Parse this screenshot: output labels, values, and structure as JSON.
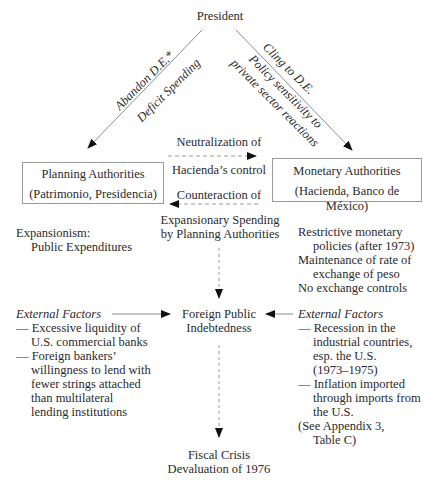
{
  "diagram": {
    "top_node": "President",
    "left_branch": {
      "line1": "Abandon D.E.*",
      "line2": "Deficit Spending"
    },
    "right_branch": {
      "line1": "Cling to D.E.",
      "line2": "Policy sensitivity to",
      "line3": "private sector reactions"
    },
    "planning_box": {
      "title": "Planning Authorities",
      "subtitle": "(Patrimonio, Presidencia)"
    },
    "monetary_box": {
      "title": "Monetary Authorities",
      "subtitle": "(Hacienda, Banco de México)"
    },
    "middle_labels": {
      "top": "Neutralization of",
      "center": "Hacienda’s control",
      "bottom": "Counteraction of"
    },
    "expansionism": {
      "line1": "Expansionism:",
      "line2": "Public Expenditures"
    },
    "expansionary_spending": {
      "line1": "Expansionary Spending",
      "line2": "by Planning Authorities"
    },
    "monetary_policies": {
      "line1": "Restrictive monetary",
      "line2": "policies (after 1973)",
      "line3": "Maintenance of rate of",
      "line4": "exchange of peso",
      "line5": "No exchange controls"
    },
    "left_external": {
      "heading": "External Factors",
      "items": [
        "— Excessive liquidity of",
        "U.S. commercial banks",
        "— Foreign bankers’",
        "willingness to lend with",
        "fewer strings attached",
        "than multilateral",
        "lending institutions"
      ]
    },
    "center_node": {
      "line1": "Foreign Public",
      "line2": "Indebtedness"
    },
    "right_external": {
      "heading": "External Factors",
      "items": [
        "— Recession in the",
        "industrial countries,",
        "esp. the U.S.",
        "(1973–1975)",
        "— Inflation imported",
        "through imports from",
        "the U.S.",
        "(See Appendix 3,",
        "Table C)"
      ]
    },
    "bottom_node": {
      "line1": "Fiscal Crisis",
      "line2": "Devaluation of 1976"
    },
    "colors": {
      "line": "#8c8c8c",
      "arrowhead": "#111111",
      "text": "#2a2a2a",
      "box_border": "#9a9a9a"
    }
  }
}
